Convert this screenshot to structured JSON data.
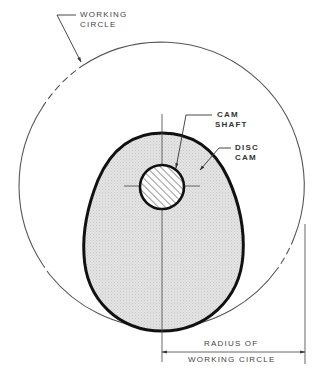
{
  "diagram": {
    "type": "technical-drawing",
    "labels": {
      "working_circle_line1": "WORKING",
      "working_circle_line2": "CIRCLE",
      "cam_shaft_line1": "CAM",
      "cam_shaft_line2": "SHAFT",
      "disc_cam_line1": "DISC",
      "disc_cam_line2": "CAM",
      "radius_line1": "RADIUS OF",
      "radius_line2": "WORKING CIRCLE"
    },
    "colors": {
      "line": "#222222",
      "thin_line": "#555555",
      "cam_fill": "#e2e2e2",
      "background": "#ffffff"
    },
    "geometry": {
      "working_circle": {
        "cx": 161,
        "cy": 186,
        "r": 143
      },
      "shaft": {
        "cx": 162,
        "cy": 187,
        "r": 22
      },
      "cam_top": [
        162,
        133
      ],
      "cam_bottom": [
        162,
        331
      ],
      "dimension_line_y": 352,
      "dimension_from_x": 162,
      "dimension_to_x": 305
    }
  }
}
